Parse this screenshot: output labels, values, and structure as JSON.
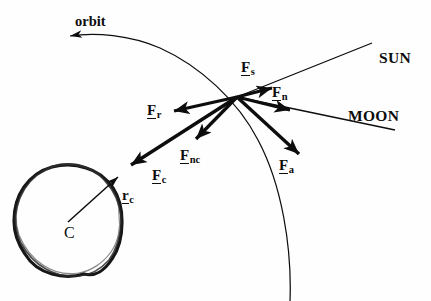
{
  "figure": {
    "background_color": "#fefefe",
    "ink_color": "#0d0d0d",
    "width": 431,
    "height": 301
  },
  "labels": {
    "orbit": {
      "text": "orbit",
      "x": 75,
      "y": 14
    },
    "sun": {
      "text": "SUN",
      "x": 379,
      "y": 50
    },
    "moon": {
      "text": "MOON",
      "x": 348,
      "y": 108
    },
    "center": {
      "text": "C",
      "x": 64,
      "y": 225
    }
  },
  "vectors": [
    {
      "name": "F_s",
      "base": "F",
      "subscript": "s",
      "label_x": 241,
      "label_y": 60,
      "from": [
        237,
        97
      ],
      "to": [
        272,
        88
      ],
      "description": "solar radiation pressure force toward SUN"
    },
    {
      "name": "F_n",
      "base": "F",
      "subscript": "n",
      "label_x": 272,
      "label_y": 85,
      "from": [
        237,
        97
      ],
      "to": [
        290,
        110
      ],
      "description": "lunar perturbation force toward MOON"
    },
    {
      "name": "F_r",
      "base": "F",
      "subscript": "r",
      "label_x": 147,
      "label_y": 103,
      "from": [
        237,
        97
      ],
      "to": [
        174,
        111
      ],
      "description": "along-track / resistive force"
    },
    {
      "name": "F_nc",
      "base": "F",
      "subscript": "nc",
      "label_x": 180,
      "label_y": 148,
      "from": [
        237,
        97
      ],
      "to": [
        196,
        139
      ],
      "description": "non-central gravitational force"
    },
    {
      "name": "F_c",
      "base": "F",
      "subscript": "c",
      "label_x": 152,
      "label_y": 168,
      "from": [
        237,
        97
      ],
      "to": [
        131,
        165
      ],
      "description": "central gravitational force toward C"
    },
    {
      "name": "F_a",
      "base": "F",
      "subscript": "a",
      "label_x": 279,
      "label_y": 158,
      "from": [
        237,
        97
      ],
      "to": [
        299,
        154
      ],
      "description": "aerodynamic drag force"
    },
    {
      "name": "r_c",
      "base": "r",
      "subscript": "c",
      "label_x": 122,
      "label_y": 188,
      "from": [
        68,
        222
      ],
      "to": [
        118,
        177
      ],
      "description": "position vector from center C to satellite"
    }
  ],
  "geometry": {
    "satellite_point": [
      237,
      97
    ],
    "central_body": {
      "center": [
        68,
        222
      ],
      "radius": 54,
      "style": "hand-drawn irregular thick outline"
    },
    "orbit_arc": {
      "arrow_tip": [
        64,
        36
      ],
      "passes_through": [
        237,
        97
      ],
      "exit_point": [
        290,
        300
      ]
    },
    "sun_line": {
      "from": [
        237,
        97
      ],
      "to": [
        372,
        43
      ]
    },
    "moon_line": {
      "from": [
        237,
        97
      ],
      "to": [
        395,
        130
      ]
    }
  }
}
